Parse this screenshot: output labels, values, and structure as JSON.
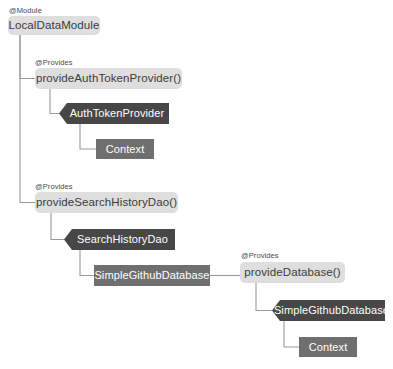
{
  "diagram": {
    "background_color": "#ffffff",
    "palette": {
      "module_fill": "#dedede",
      "module_text": "#3b3b3b",
      "banner_fill": "#474747",
      "banner_text": "#ffffff",
      "plain_fill": "#6f6f6f",
      "plain_text": "#ffffff",
      "edge_color": "#9a9a9a",
      "annotation_text": "#4a4a4a"
    },
    "annotations": [
      {
        "id": "ann-module",
        "label": "@Module",
        "x": 9,
        "y": 7
      },
      {
        "id": "ann-provides-auth",
        "label": "@Provides",
        "x": 35,
        "y": 59
      },
      {
        "id": "ann-provides-dao",
        "label": "@Provides",
        "x": 35,
        "y": 183
      },
      {
        "id": "ann-provides-db",
        "label": "@Provides",
        "x": 241,
        "y": 252
      }
    ],
    "nodes": [
      {
        "id": "local-data-module",
        "label": "LocalDataModule",
        "kind": "module",
        "x": 8,
        "y": 16,
        "w": 92,
        "h": 19
      },
      {
        "id": "provide-auth-token-provider",
        "label": "provideAuthTokenProvider()",
        "kind": "module",
        "x": 35,
        "y": 68,
        "w": 147,
        "h": 21
      },
      {
        "id": "auth-token-provider",
        "label": "AuthTokenProvider",
        "kind": "banner",
        "x": 59,
        "y": 103,
        "w": 110,
        "h": 21
      },
      {
        "id": "context-auth",
        "label": "Context",
        "kind": "plain",
        "x": 96,
        "y": 139,
        "w": 58,
        "h": 20
      },
      {
        "id": "provide-search-history-dao",
        "label": "provideSearchHistoryDao()",
        "kind": "module",
        "x": 35,
        "y": 192,
        "w": 143,
        "h": 21
      },
      {
        "id": "search-history-dao",
        "label": "SearchHistoryDao",
        "kind": "banner",
        "x": 64,
        "y": 229,
        "w": 111,
        "h": 21
      },
      {
        "id": "simple-github-database-dep",
        "label": "SimpleGithubDatabase",
        "kind": "plain",
        "x": 94,
        "y": 265,
        "w": 116,
        "h": 21
      },
      {
        "id": "provide-database",
        "label": "provideDatabase()",
        "kind": "module",
        "x": 240,
        "y": 262,
        "w": 105,
        "h": 21
      },
      {
        "id": "simple-github-database",
        "label": "SimpleGithubDatabase",
        "kind": "banner",
        "x": 272,
        "y": 300,
        "w": 113,
        "h": 21
      },
      {
        "id": "context-db",
        "label": "Context",
        "kind": "plain",
        "x": 299,
        "y": 337,
        "w": 58,
        "h": 20
      }
    ],
    "edges": [
      {
        "id": "edge-module-to-auth",
        "from": "local-data-module",
        "to": "provide-auth-token-provider",
        "path": "M 20 35 L 20 78.5 L 35 78.5"
      },
      {
        "id": "edge-module-to-dao",
        "from": "local-data-module",
        "to": "provide-search-history-dao",
        "path": "M 20 35 L 20 202.5 L 35 202.5"
      },
      {
        "id": "edge-auth-to-type",
        "from": "provide-auth-token-provider",
        "to": "auth-token-provider",
        "path": "M 50 89 L 50 113.5 L 59 113.5"
      },
      {
        "id": "edge-type-to-context",
        "from": "auth-token-provider",
        "to": "context-auth",
        "path": "M 80 124 L 80 149 L 96 149"
      },
      {
        "id": "edge-dao-to-type",
        "from": "provide-search-history-dao",
        "to": "search-history-dao",
        "path": "M 51 213 L 51 239.5 L 64 239.5"
      },
      {
        "id": "edge-dao-to-db",
        "from": "search-history-dao",
        "to": "simple-github-database-dep",
        "path": "M 80 250 L 80 275.5 L 94 275.5"
      },
      {
        "id": "edge-db-to-provider",
        "from": "simple-github-database-dep",
        "to": "provide-database",
        "path": "M 210 275.5 L 240 275.5"
      },
      {
        "id": "edge-provider-to-type",
        "from": "provide-database",
        "to": "simple-github-database",
        "path": "M 256 283 L 256 310.5 L 272 310.5"
      },
      {
        "id": "edge-type-to-context-db",
        "from": "simple-github-database",
        "to": "context-db",
        "path": "M 284 321 L 284 347 L 299 347"
      }
    ]
  }
}
